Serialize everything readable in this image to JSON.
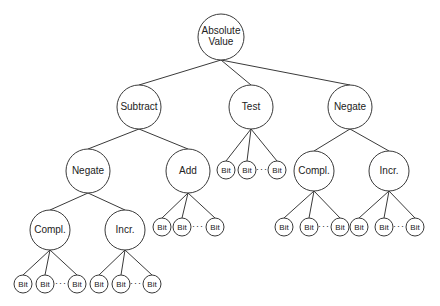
{
  "diagram": {
    "colors": {
      "stroke": "#3a3a3a",
      "fill": "#ffffff",
      "text": "#222222"
    },
    "nodes": [
      {
        "id": "abs",
        "label": [
          "Absolute",
          "Value"
        ],
        "x": 221,
        "y": 37,
        "r": 23
      },
      {
        "id": "subtract",
        "label": [
          "Subtract"
        ],
        "x": 139,
        "y": 107,
        "r": 22
      },
      {
        "id": "test",
        "label": [
          "Test"
        ],
        "x": 251,
        "y": 107,
        "r": 22
      },
      {
        "id": "negate_r",
        "label": [
          "Negate"
        ],
        "x": 350,
        "y": 107,
        "r": 22
      },
      {
        "id": "negate_l",
        "label": [
          "Negate"
        ],
        "x": 88,
        "y": 171,
        "r": 22
      },
      {
        "id": "add",
        "label": [
          "Add"
        ],
        "x": 188,
        "y": 171,
        "r": 22
      },
      {
        "id": "compl_r",
        "label": [
          "Compl."
        ],
        "x": 314,
        "y": 171,
        "r": 20
      },
      {
        "id": "incr_r",
        "label": [
          "Incr."
        ],
        "x": 389,
        "y": 171,
        "r": 20
      },
      {
        "id": "compl_l",
        "label": [
          "Compl."
        ],
        "x": 50,
        "y": 230,
        "r": 20
      },
      {
        "id": "incr_l",
        "label": [
          "Incr."
        ],
        "x": 125,
        "y": 230,
        "r": 20
      }
    ],
    "edges": [
      [
        "abs",
        "subtract"
      ],
      [
        "abs",
        "test"
      ],
      [
        "abs",
        "negate_r"
      ],
      [
        "subtract",
        "negate_l"
      ],
      [
        "subtract",
        "add"
      ],
      [
        "negate_r",
        "compl_r"
      ],
      [
        "negate_r",
        "incr_r"
      ],
      [
        "negate_l",
        "compl_l"
      ],
      [
        "negate_l",
        "incr_l"
      ]
    ],
    "bit_groups": [
      {
        "parent": "test",
        "bits": [
          [
            226,
            170
          ],
          [
            247,
            170
          ],
          [
            277,
            170
          ]
        ],
        "dots": [
          262,
          170
        ]
      },
      {
        "parent": "add",
        "bits": [
          [
            162,
            227
          ],
          [
            182,
            227
          ],
          [
            215,
            227
          ]
        ],
        "dots": [
          198,
          227
        ]
      },
      {
        "parent": "compl_r",
        "bits": [
          [
            284,
            227
          ],
          [
            309,
            227
          ],
          [
            340,
            227
          ]
        ],
        "dots": [
          324,
          227
        ]
      },
      {
        "parent": "incr_r",
        "bits": [
          [
            359,
            227
          ],
          [
            384,
            227
          ],
          [
            415,
            227
          ]
        ],
        "dots": [
          399,
          227
        ]
      },
      {
        "parent": "compl_l",
        "bits": [
          [
            23,
            284
          ],
          [
            45,
            284
          ],
          [
            77,
            284
          ]
        ],
        "dots": [
          61,
          284
        ]
      },
      {
        "parent": "incr_l",
        "bits": [
          [
            99,
            284
          ],
          [
            121,
            284
          ],
          [
            152,
            284
          ]
        ],
        "dots": [
          136,
          284
        ]
      }
    ],
    "bit_label": "Bit",
    "bit_radius": 9,
    "ellipsis": "···"
  }
}
